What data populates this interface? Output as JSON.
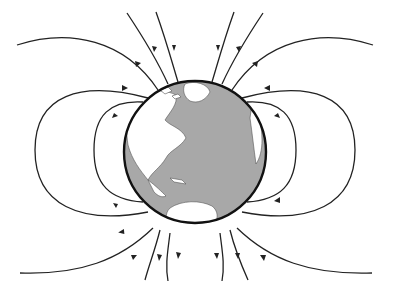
{
  "diagram": {
    "title": "Earth's magnetic field lines",
    "colors": {
      "background": "#ffffff",
      "ocean": "#a8a8a8",
      "land": "#ffffff",
      "outline": "#111111",
      "field_lines": "#222222"
    },
    "globe": {
      "cx": 195,
      "cy": 152,
      "r": 71
    },
    "field_line_direction": "enter at top (north), exit at bottom (south)",
    "field_line_count": 14
  }
}
